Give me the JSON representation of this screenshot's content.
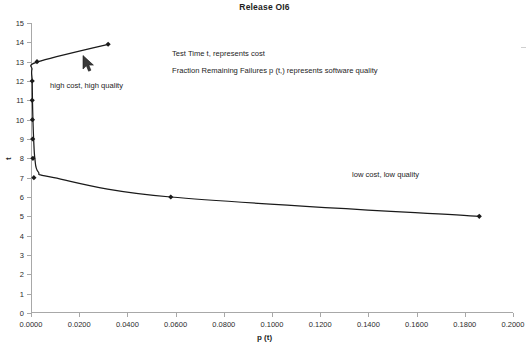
{
  "chart_data": {
    "type": "line",
    "title": "Release OI6",
    "xlabel": "p (t)",
    "ylabel": "t",
    "xlim": [
      0.0,
      0.2
    ],
    "ylim": [
      0,
      15
    ],
    "grid": false,
    "legend": "none",
    "xticks": [
      "0.0000",
      "0.0200",
      "0.0400",
      "0.0600",
      "0.0800",
      "0.1000",
      "0.1200",
      "0.1400",
      "0.1600",
      "0.1800",
      "0.2000"
    ],
    "xtick_values": [
      0.0,
      0.02,
      0.04,
      0.06,
      0.08,
      0.1,
      0.12,
      0.14,
      0.16,
      0.18,
      0.2
    ],
    "yticks": [
      "0",
      "1",
      "2",
      "3",
      "4",
      "5",
      "6",
      "7",
      "8",
      "9",
      "10",
      "11",
      "12",
      "13",
      "14",
      "15"
    ],
    "ytick_values": [
      0,
      1,
      2,
      3,
      4,
      5,
      6,
      7,
      8,
      9,
      10,
      11,
      12,
      13,
      14,
      15
    ],
    "series": [
      {
        "name": "reliability curve",
        "marker": "diamond",
        "color": "#1a1a1a",
        "x": [
          0.186,
          0.058,
          0.0095,
          0.003,
          0.0016,
          0.0011,
          0.0008,
          0.0006,
          0.0005,
          0.0004,
          0.003,
          0.032
        ],
        "y": [
          5.0,
          6.0,
          7.0,
          7.3,
          8.0,
          9.0,
          10.0,
          11.0,
          12.0,
          12.6,
          13.0,
          13.9
        ]
      }
    ],
    "markers": [
      {
        "x": 0.186,
        "y": 5.0
      },
      {
        "x": 0.058,
        "y": 6.0
      },
      {
        "x": 0.0012,
        "y": 7.0
      },
      {
        "x": 0.0008,
        "y": 8.0
      },
      {
        "x": 0.0007,
        "y": 9.0
      },
      {
        "x": 0.0006,
        "y": 10.0
      },
      {
        "x": 0.0005,
        "y": 11.0
      },
      {
        "x": 0.0005,
        "y": 12.0
      },
      {
        "x": 0.0025,
        "y": 13.0
      },
      {
        "x": 0.032,
        "y": 13.9
      }
    ],
    "annotations": [
      {
        "id": "note-cost",
        "text": "Test Time t, represents cost"
      },
      {
        "id": "note-quality",
        "text": "Fraction Remaining Failures p (t,) represents software quality"
      },
      {
        "id": "label-high",
        "text": "high cost, high quality"
      },
      {
        "id": "label-low",
        "text": "low cost, low quality"
      }
    ],
    "cursor": {
      "name": "mouse-pointer",
      "x_px": 88,
      "y_px": 62
    }
  },
  "colors": {
    "series": "#1a1a1a",
    "axis": "#a8a8a8",
    "text": "#2b2b2b",
    "background": "#ffffff"
  }
}
